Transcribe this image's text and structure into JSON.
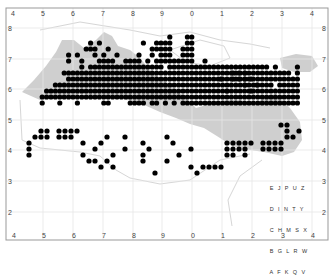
{
  "map": {
    "title": "",
    "top_ticks": [
      "4",
      "5",
      "6",
      "7",
      "8",
      "9",
      "0",
      "1",
      "2",
      "3",
      "4"
    ],
    "bottom_ticks": [
      "4",
      "5",
      "6",
      "7",
      "8",
      "9",
      "0",
      "1",
      "2",
      "3",
      "4"
    ],
    "left_ticks": [
      "8",
      "7",
      "6",
      "5",
      "4",
      "3",
      "2"
    ],
    "right_ticks": [
      "8",
      "7",
      "6",
      "5",
      "4",
      "3",
      "2"
    ],
    "colors": {
      "dot": "#000000",
      "land_shaded": "#cfcfcf",
      "coast": "#d8d8d8",
      "grid": "#e6e6e6",
      "frame": "#999999"
    },
    "legend_key": [
      [
        "E",
        "J",
        "P",
        "U",
        "Z"
      ],
      [
        "D",
        "I",
        "N",
        "T",
        "Y"
      ],
      [
        "C",
        "H",
        "M",
        "S",
        "X"
      ],
      [
        "B",
        "G",
        "L",
        "R",
        "W"
      ],
      [
        "A",
        "F",
        "K",
        "Q",
        "V"
      ]
    ],
    "dot_rows": [
      {
        "y": 37,
        "cols": [
          37,
          41,
          42
        ]
      },
      {
        "y": 43,
        "cols": [
          19,
          21,
          31,
          34,
          35,
          36,
          37,
          41,
          42
        ]
      },
      {
        "y": 49,
        "cols": [
          18,
          19,
          20,
          23,
          33,
          34,
          35,
          36,
          37,
          40,
          41,
          42
        ]
      },
      {
        "y": 55,
        "cols": [
          14,
          16,
          20,
          22,
          25,
          30,
          33,
          35,
          36,
          37,
          40,
          41,
          42
        ]
      },
      {
        "y": 61,
        "cols": [
          14,
          17,
          21,
          22,
          23,
          24,
          27,
          28,
          29,
          30,
          32,
          34,
          35,
          36,
          37,
          38,
          39,
          40,
          41,
          42,
          45
        ]
      },
      {
        "y": 67,
        "cols": [
          17,
          19,
          20,
          21,
          22,
          23,
          24,
          25,
          26,
          27,
          28,
          29,
          30,
          31,
          32,
          33,
          34,
          35,
          37,
          38,
          39,
          40,
          41,
          42,
          43,
          44,
          45,
          46,
          47,
          48,
          49,
          50,
          51,
          52,
          53,
          54,
          55,
          56,
          57,
          58,
          59,
          61,
          66,
          67,
          68,
          69
        ]
      },
      {
        "y": 73,
        "cols": [
          13,
          14,
          15,
          16,
          17,
          18,
          19,
          20,
          21,
          22,
          23,
          24,
          25,
          26,
          27,
          28,
          29,
          30,
          31,
          32,
          33,
          34,
          35,
          36,
          37,
          38,
          39,
          40,
          41,
          42,
          43,
          44,
          45,
          46,
          47,
          48,
          49,
          50,
          51,
          52,
          53,
          54,
          55,
          56,
          57,
          58,
          59,
          60,
          61,
          62,
          63,
          64,
          66,
          67,
          68,
          69,
          70
        ]
      },
      {
        "y": 79,
        "cols": [
          14,
          15,
          16,
          17,
          18,
          19,
          20,
          21,
          22,
          23,
          24,
          25,
          26,
          27,
          28,
          29,
          30,
          31,
          32,
          33,
          34,
          35,
          36,
          37,
          38,
          39,
          40,
          41,
          42,
          43,
          44,
          45,
          46,
          47,
          48,
          49,
          50,
          51,
          52,
          53,
          54,
          55,
          56,
          57,
          58,
          59,
          60,
          61,
          62,
          63,
          64,
          65,
          66,
          67,
          68,
          69,
          70,
          71
        ]
      },
      {
        "y": 85,
        "cols": [
          11,
          12,
          13,
          14,
          15,
          16,
          17,
          18,
          19,
          20,
          21,
          22,
          23,
          24,
          25,
          26,
          27,
          28,
          29,
          30,
          31,
          32,
          33,
          34,
          35,
          36,
          37,
          38,
          39,
          40,
          41,
          42,
          43,
          44,
          45,
          46,
          47,
          48,
          49,
          50,
          51,
          52,
          53,
          54,
          55,
          56,
          57,
          58,
          59,
          60,
          62,
          63,
          64,
          65,
          66,
          67,
          68
        ]
      },
      {
        "y": 91,
        "cols": [
          9,
          10,
          11,
          12,
          13,
          14,
          15,
          16,
          17,
          18,
          19,
          20,
          21,
          22,
          23,
          24,
          25,
          26,
          27,
          28,
          29,
          30,
          31,
          32,
          33,
          34,
          35,
          36,
          37,
          38,
          39,
          40,
          41,
          42,
          43,
          44,
          45,
          46,
          47,
          48,
          49,
          50,
          51,
          52,
          53,
          54,
          55,
          56,
          57,
          58,
          59,
          60,
          61,
          62,
          63,
          64,
          65,
          66,
          67
        ]
      },
      {
        "y": 97,
        "cols": [
          8,
          9,
          10,
          11,
          12,
          13,
          14,
          15,
          16,
          17,
          18,
          19,
          20,
          21,
          22,
          23,
          24,
          25,
          26,
          27,
          28,
          29,
          30,
          31,
          32,
          33,
          34,
          35,
          36,
          37,
          38,
          39,
          40,
          41,
          42,
          43,
          44,
          45,
          46,
          47,
          48,
          49,
          50,
          51,
          52,
          53,
          54,
          55,
          56,
          57,
          58,
          59,
          60,
          61,
          62,
          63,
          64,
          65,
          66,
          67
        ]
      },
      {
        "y": 103,
        "cols": [
          8,
          12,
          16,
          22,
          23,
          28,
          29,
          30,
          31,
          33,
          34,
          36,
          38,
          40,
          41,
          42,
          43,
          44,
          45,
          46,
          47,
          48,
          49,
          50,
          51,
          52,
          53,
          54,
          55,
          56,
          57,
          58,
          59,
          60,
          61,
          62,
          63,
          64,
          65,
          66,
          67,
          68
        ]
      }
    ]
  }
}
